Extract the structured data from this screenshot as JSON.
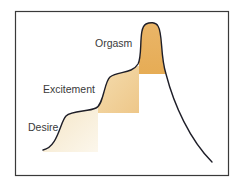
{
  "diagram": {
    "type": "staged-response-curve",
    "stages": [
      {
        "label": "Desire",
        "order": 1,
        "shade": "light"
      },
      {
        "label": "Excitement",
        "order": 2,
        "shade": "medium"
      },
      {
        "label": "Orgasm",
        "order": 3,
        "shade": "dark"
      }
    ],
    "colors": {
      "frame": "#3a3a3a",
      "curve": "#1e1e28",
      "desire_fill_top": "#f3e3c2",
      "desire_fill_bottom": "#fbf5e8",
      "excitement_fill_top": "#ecc37e",
      "excitement_fill_bottom": "#f6e2bb",
      "orgasm_fill_top": "#e8b464",
      "orgasm_fill_bottom": "#e7ad57",
      "text": "#3a3a3a"
    }
  }
}
